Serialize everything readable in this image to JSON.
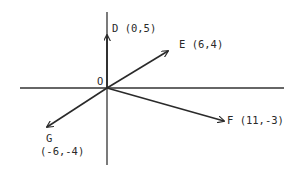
{
  "diagram": {
    "type": "vector-plot",
    "origin_label": "O",
    "axes": {
      "color": "#333333",
      "x_axis": {
        "x1": 20,
        "x2": 284,
        "y": 88
      },
      "y_axis": {
        "x": 107,
        "y1": 12,
        "y2": 165
      }
    },
    "origin_px": {
      "x": 107,
      "y": 88
    },
    "vectors": [
      {
        "name": "D",
        "coords": [
          0,
          5
        ],
        "label": "D (0,5)",
        "tip_px": [
          107,
          34
        ]
      },
      {
        "name": "E",
        "coords": [
          6,
          4
        ],
        "label": "E (6,4)",
        "tip_px": [
          168,
          51
        ]
      },
      {
        "name": "F",
        "coords": [
          11,
          -3
        ],
        "label": "F (11,-3)",
        "tip_px": [
          224,
          121
        ]
      },
      {
        "name": "G",
        "coords": [
          -6,
          -4
        ],
        "label_name": "G",
        "label_coords": "(-6,-4)",
        "tip_px": [
          46,
          127
        ]
      }
    ],
    "labels": {
      "origin": "O",
      "D": "D (0,5)",
      "E": "E (6,4)",
      "F": "F (11,-3)",
      "G_name": "G",
      "G_coords": "(-6,-4)"
    }
  }
}
